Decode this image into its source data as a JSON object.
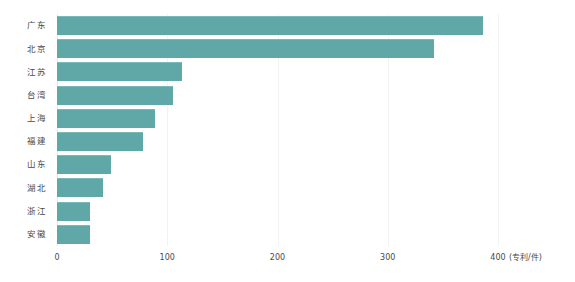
{
  "chart_data": {
    "type": "bar",
    "orientation": "horizontal",
    "title": "",
    "subtitle": "",
    "xlabel": "(专利/件)",
    "ylabel": "",
    "categories": [
      "广东",
      "北京",
      "江苏",
      "台湾",
      "上海",
      "福建",
      "山东",
      "湖北",
      "浙江",
      "安徽"
    ],
    "values": [
      386,
      342,
      113,
      105,
      89,
      78,
      49,
      42,
      30,
      30
    ],
    "series": [
      {
        "name": "专利数量",
        "values": [
          386,
          342,
          113,
          105,
          89,
          78,
          49,
          42,
          30,
          30
        ]
      }
    ],
    "xlim": [
      0,
      400
    ],
    "xticks": [
      0,
      100,
      200,
      300,
      400
    ],
    "xtick_labels": [
      "0",
      "100",
      "200",
      "300",
      "400"
    ],
    "grid": true,
    "grid_axis": "x",
    "legend": false,
    "legend_position": "none",
    "bar_color": "#60a8a8",
    "bar_edge_color": "#7ab9b8",
    "background_color": "#ffffff",
    "gridline_color": "#f1f2f3",
    "axis_color": "#e6e8ea",
    "text_color": "#4a4a4a",
    "unit_note": "(专利/件)"
  },
  "axis": {
    "unit_label": "(专利/件)"
  }
}
